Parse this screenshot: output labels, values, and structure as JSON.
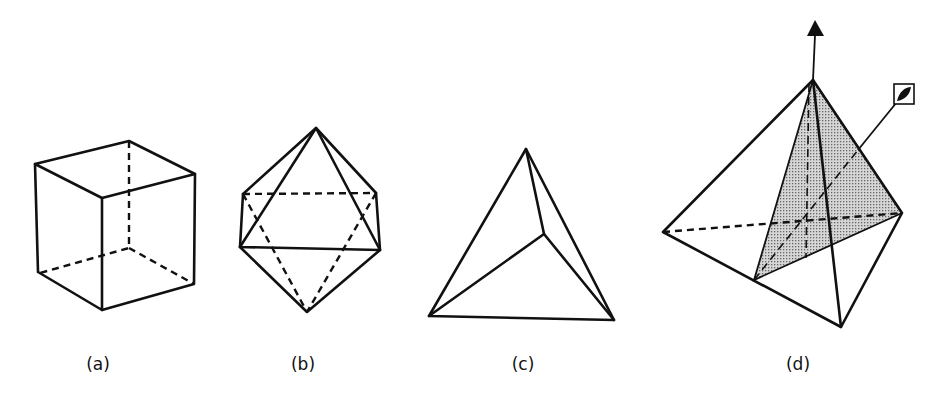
{
  "figures": [
    {
      "id": "a",
      "label": "(a)",
      "shape": "cube"
    },
    {
      "id": "b",
      "label": "(b)",
      "shape": "octahedron"
    },
    {
      "id": "c",
      "label": "(c)",
      "shape": "tetrahedron"
    },
    {
      "id": "d",
      "label": "(d)",
      "shape": "tetrahedron-with-mirror-plane-and-rotation-axes",
      "symbols": {
        "vertical_axis": "triangle-3fold-axis-icon",
        "oblique_axis": "square-with-lens-icon"
      }
    },
    {
      "id": "shading",
      "fill_color": "#bdbdbd"
    }
  ]
}
